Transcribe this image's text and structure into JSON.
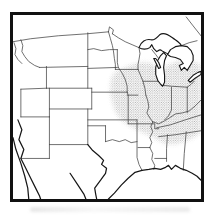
{
  "figure": {
    "title": "Range map, central and eastern United States",
    "type": "stippled distribution range map",
    "range": {
      "fill_style": "halftone dot stipple",
      "areas": [
        "southern Wisconsin",
        "southern Michigan",
        "eastern Iowa",
        "Illinois",
        "Indiana",
        "Ohio",
        "eastern Missouri",
        "Kentucky",
        "Tennessee",
        "northern Arkansas",
        "northern Mississippi",
        "northern Alabama"
      ]
    },
    "colors": {
      "background": "#ffffff",
      "frame": "#111111",
      "state_line": "#3f3f3f",
      "outline": "#161616",
      "stipple_dot": "#8f8f8f"
    }
  }
}
